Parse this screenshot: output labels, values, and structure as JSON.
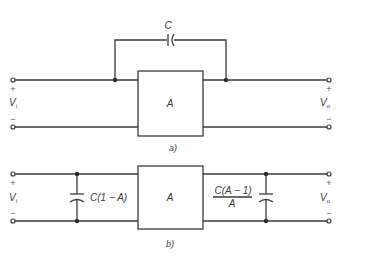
{
  "figure_a": {
    "caption": "a)",
    "amplifier_label": "A",
    "feedback_capacitor_label": "C",
    "input": {
      "symbol": "V",
      "subscript": "i",
      "plus": "+",
      "minus": "−"
    },
    "output": {
      "symbol": "V",
      "subscript": "o",
      "plus": "+",
      "minus": "−"
    }
  },
  "figure_b": {
    "caption": "b)",
    "amplifier_label": "A",
    "input_capacitor_label": "C(1 − A)",
    "output_capacitor_numerator": "C(A − 1)",
    "output_capacitor_denominator": "A",
    "input": {
      "symbol": "V",
      "subscript": "i",
      "plus": "+",
      "minus": "−"
    },
    "output": {
      "symbol": "V",
      "subscript": "o",
      "plus": "+",
      "minus": "−"
    }
  },
  "colors": {
    "ink": "#3a3a3a",
    "background": "#ffffff"
  }
}
